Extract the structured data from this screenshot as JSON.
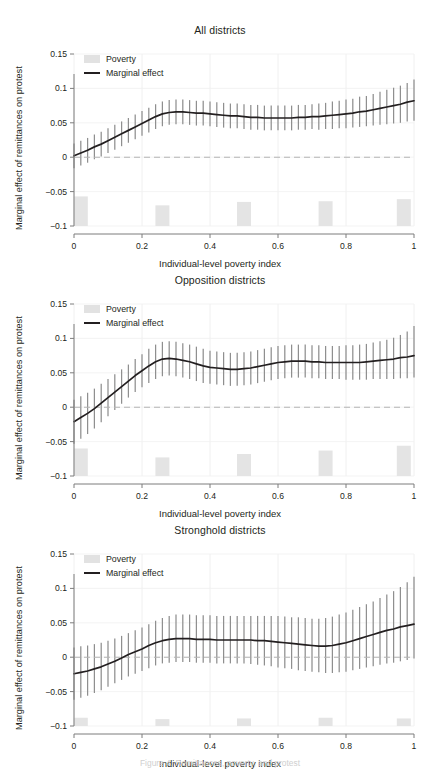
{
  "figure": {
    "caption": "Figure 4. Remittances, poverty, and protest",
    "axis_label_y": "Marginal effect of remittances on protest",
    "axis_label_x": "Individual-level poverty index",
    "legend": {
      "poverty_label": "Poverty",
      "marginal_label": "Marginal effect",
      "poverty_swatch_color": "#e2e2e2",
      "marginal_line_color": "#231f20"
    },
    "colors": {
      "line": "#231f20",
      "errorbar": "#8f8f8f",
      "poverty_bar": "#e4e4e4",
      "gridline": "#f0f0f0",
      "zero_line": "#b5b5b5",
      "axis": "#7d7d7d",
      "text": "#231f20"
    }
  },
  "chart_data": [
    {
      "type": "line",
      "title": "All districts",
      "xlabel": "Individual-level poverty index",
      "ylabel": "Marginal effect of remittances on protest",
      "xlim": [
        0,
        1
      ],
      "ylim": [
        -0.1,
        0.15
      ],
      "xticks": [
        0,
        0.2,
        0.4,
        0.6,
        0.8,
        1
      ],
      "xticklabels": [
        "0",
        "0.2",
        "0.4",
        "0.6",
        "0.8",
        "1"
      ],
      "yticks": [
        -0.1,
        -0.05,
        0,
        0.05,
        0.1,
        0.15
      ],
      "yticklabels": [
        "−0.1",
        "−0.05",
        "0",
        "0.05",
        "0.1",
        "0.15"
      ],
      "grid": true,
      "legend_position": "top-left",
      "zero_reference_line": 0,
      "series": [
        {
          "name": "Marginal effect",
          "x": [
            0.0,
            0.02,
            0.04,
            0.06,
            0.08,
            0.1,
            0.12,
            0.14,
            0.16,
            0.18,
            0.2,
            0.22,
            0.24,
            0.26,
            0.28,
            0.3,
            0.32,
            0.34,
            0.36,
            0.38,
            0.4,
            0.42,
            0.44,
            0.46,
            0.48,
            0.5,
            0.52,
            0.54,
            0.56,
            0.58,
            0.6,
            0.62,
            0.64,
            0.66,
            0.68,
            0.7,
            0.72,
            0.74,
            0.76,
            0.78,
            0.8,
            0.82,
            0.84,
            0.86,
            0.88,
            0.9,
            0.92,
            0.94,
            0.96,
            0.98,
            1.0
          ],
          "values": [
            0.002,
            0.006,
            0.01,
            0.015,
            0.019,
            0.024,
            0.029,
            0.034,
            0.039,
            0.044,
            0.049,
            0.054,
            0.059,
            0.063,
            0.065,
            0.066,
            0.066,
            0.065,
            0.064,
            0.064,
            0.063,
            0.062,
            0.061,
            0.06,
            0.06,
            0.059,
            0.058,
            0.058,
            0.057,
            0.057,
            0.057,
            0.057,
            0.057,
            0.058,
            0.058,
            0.059,
            0.059,
            0.06,
            0.061,
            0.062,
            0.063,
            0.064,
            0.066,
            0.067,
            0.069,
            0.071,
            0.073,
            0.075,
            0.077,
            0.08,
            0.082
          ],
          "ci_lower": [
            -0.016,
            -0.012,
            -0.008,
            -0.003,
            0.001,
            0.006,
            0.011,
            0.016,
            0.021,
            0.026,
            0.031,
            0.036,
            0.041,
            0.045,
            0.047,
            0.048,
            0.048,
            0.047,
            0.046,
            0.046,
            0.045,
            0.044,
            0.043,
            0.042,
            0.042,
            0.041,
            0.04,
            0.04,
            0.039,
            0.039,
            0.039,
            0.039,
            0.039,
            0.04,
            0.04,
            0.041,
            0.04,
            0.041,
            0.041,
            0.042,
            0.042,
            0.043,
            0.044,
            0.045,
            0.046,
            0.047,
            0.048,
            0.049,
            0.05,
            0.052,
            0.053
          ],
          "ci_upper": [
            0.02,
            0.024,
            0.028,
            0.033,
            0.037,
            0.042,
            0.047,
            0.052,
            0.057,
            0.062,
            0.067,
            0.072,
            0.077,
            0.081,
            0.083,
            0.084,
            0.084,
            0.083,
            0.082,
            0.082,
            0.081,
            0.08,
            0.079,
            0.078,
            0.078,
            0.077,
            0.076,
            0.076,
            0.075,
            0.075,
            0.075,
            0.075,
            0.075,
            0.076,
            0.076,
            0.077,
            0.078,
            0.079,
            0.081,
            0.082,
            0.084,
            0.085,
            0.088,
            0.089,
            0.092,
            0.095,
            0.098,
            0.101,
            0.104,
            0.108,
            0.113
          ]
        }
      ],
      "poverty_bars": [
        {
          "x": 0.02,
          "top": -0.057
        },
        {
          "x": 0.26,
          "top": -0.07
        },
        {
          "x": 0.5,
          "top": -0.065
        },
        {
          "x": 0.74,
          "top": -0.064
        },
        {
          "x": 0.97,
          "top": -0.061
        }
      ]
    },
    {
      "type": "line",
      "title": "Opposition districts",
      "xlabel": "Individual-level poverty index",
      "ylabel": "Marginal effect of remittances on protest",
      "xlim": [
        0,
        1
      ],
      "ylim": [
        -0.1,
        0.15
      ],
      "xticks": [
        0,
        0.2,
        0.4,
        0.6,
        0.8,
        1
      ],
      "xticklabels": [
        "0",
        "0.2",
        "0.4",
        "0.6",
        "0.8",
        "1"
      ],
      "yticks": [
        -0.1,
        -0.05,
        0,
        0.05,
        0.1,
        0.15
      ],
      "yticklabels": [
        "−0.1",
        "−0.05",
        "0",
        "0.05",
        "0.1",
        "0.15"
      ],
      "grid": true,
      "legend_position": "top-left",
      "zero_reference_line": 0,
      "series": [
        {
          "name": "Marginal effect",
          "x": [
            0.0,
            0.02,
            0.04,
            0.06,
            0.08,
            0.1,
            0.12,
            0.14,
            0.16,
            0.18,
            0.2,
            0.22,
            0.24,
            0.26,
            0.28,
            0.3,
            0.32,
            0.34,
            0.36,
            0.38,
            0.4,
            0.42,
            0.44,
            0.46,
            0.48,
            0.5,
            0.52,
            0.54,
            0.56,
            0.58,
            0.6,
            0.62,
            0.64,
            0.66,
            0.68,
            0.7,
            0.72,
            0.74,
            0.76,
            0.78,
            0.8,
            0.82,
            0.84,
            0.86,
            0.88,
            0.9,
            0.92,
            0.94,
            0.96,
            0.98,
            1.0
          ],
          "values": [
            -0.021,
            -0.015,
            -0.009,
            -0.002,
            0.006,
            0.014,
            0.022,
            0.03,
            0.038,
            0.046,
            0.053,
            0.06,
            0.066,
            0.07,
            0.071,
            0.07,
            0.068,
            0.066,
            0.063,
            0.06,
            0.058,
            0.057,
            0.056,
            0.055,
            0.055,
            0.056,
            0.057,
            0.059,
            0.061,
            0.063,
            0.065,
            0.066,
            0.067,
            0.067,
            0.067,
            0.066,
            0.066,
            0.065,
            0.065,
            0.065,
            0.065,
            0.065,
            0.065,
            0.066,
            0.067,
            0.068,
            0.069,
            0.07,
            0.072,
            0.073,
            0.075
          ],
          "ci_lower": [
            -0.053,
            -0.046,
            -0.039,
            -0.031,
            -0.022,
            -0.013,
            -0.004,
            0.005,
            0.014,
            0.022,
            0.029,
            0.035,
            0.041,
            0.045,
            0.046,
            0.045,
            0.043,
            0.041,
            0.038,
            0.035,
            0.034,
            0.033,
            0.032,
            0.031,
            0.031,
            0.032,
            0.033,
            0.035,
            0.037,
            0.039,
            0.041,
            0.042,
            0.043,
            0.043,
            0.043,
            0.042,
            0.042,
            0.041,
            0.041,
            0.041,
            0.04,
            0.04,
            0.04,
            0.04,
            0.041,
            0.041,
            0.041,
            0.041,
            0.042,
            0.042,
            0.043
          ],
          "ci_upper": [
            0.011,
            0.016,
            0.021,
            0.027,
            0.034,
            0.041,
            0.048,
            0.055,
            0.062,
            0.07,
            0.077,
            0.085,
            0.091,
            0.095,
            0.096,
            0.095,
            0.093,
            0.091,
            0.088,
            0.085,
            0.082,
            0.081,
            0.08,
            0.079,
            0.079,
            0.08,
            0.081,
            0.083,
            0.085,
            0.087,
            0.089,
            0.09,
            0.091,
            0.091,
            0.091,
            0.09,
            0.09,
            0.089,
            0.089,
            0.089,
            0.09,
            0.09,
            0.091,
            0.092,
            0.094,
            0.096,
            0.098,
            0.101,
            0.105,
            0.11,
            0.118
          ]
        }
      ],
      "poverty_bars": [
        {
          "x": 0.02,
          "top": -0.06
        },
        {
          "x": 0.26,
          "top": -0.073
        },
        {
          "x": 0.5,
          "top": -0.068
        },
        {
          "x": 0.74,
          "top": -0.063
        },
        {
          "x": 0.97,
          "top": -0.056
        }
      ]
    },
    {
      "type": "line",
      "title": "Stronghold districts",
      "xlabel": "Individual-level poverty index",
      "ylabel": "Marginal effect of remittances on protest",
      "xlim": [
        0,
        1
      ],
      "ylim": [
        -0.1,
        0.15
      ],
      "xticks": [
        0,
        0.2,
        0.4,
        0.6,
        0.8,
        1
      ],
      "xticklabels": [
        "0",
        "0.2",
        "0.4",
        "0.6",
        "0.8",
        "1"
      ],
      "yticks": [
        -0.1,
        -0.05,
        0,
        0.05,
        0.1,
        0.15
      ],
      "yticklabels": [
        "−0.1",
        "−0.05",
        "0",
        "0.05",
        "0.1",
        "0.15"
      ],
      "grid": true,
      "legend_position": "top-left",
      "zero_reference_line": 0,
      "series": [
        {
          "name": "Marginal effect",
          "x": [
            0.0,
            0.02,
            0.04,
            0.06,
            0.08,
            0.1,
            0.12,
            0.14,
            0.16,
            0.18,
            0.2,
            0.22,
            0.24,
            0.26,
            0.28,
            0.3,
            0.32,
            0.34,
            0.36,
            0.38,
            0.4,
            0.42,
            0.44,
            0.46,
            0.48,
            0.5,
            0.52,
            0.54,
            0.56,
            0.58,
            0.6,
            0.62,
            0.64,
            0.66,
            0.68,
            0.7,
            0.72,
            0.74,
            0.76,
            0.78,
            0.8,
            0.82,
            0.84,
            0.86,
            0.88,
            0.9,
            0.92,
            0.94,
            0.96,
            0.98,
            1.0
          ],
          "values": [
            -0.024,
            -0.022,
            -0.02,
            -0.017,
            -0.014,
            -0.01,
            -0.006,
            -0.001,
            0.004,
            0.008,
            0.012,
            0.017,
            0.021,
            0.024,
            0.026,
            0.027,
            0.027,
            0.027,
            0.026,
            0.026,
            0.026,
            0.025,
            0.025,
            0.025,
            0.025,
            0.025,
            0.025,
            0.024,
            0.024,
            0.023,
            0.022,
            0.021,
            0.02,
            0.019,
            0.018,
            0.017,
            0.016,
            0.016,
            0.017,
            0.019,
            0.021,
            0.024,
            0.027,
            0.03,
            0.033,
            0.036,
            0.039,
            0.041,
            0.044,
            0.046,
            0.048
          ],
          "ci_lower": [
            -0.062,
            -0.059,
            -0.056,
            -0.052,
            -0.048,
            -0.043,
            -0.038,
            -0.033,
            -0.028,
            -0.024,
            -0.02,
            -0.016,
            -0.012,
            -0.009,
            -0.008,
            -0.007,
            -0.007,
            -0.007,
            -0.008,
            -0.008,
            -0.008,
            -0.009,
            -0.009,
            -0.009,
            -0.009,
            -0.009,
            -0.01,
            -0.011,
            -0.012,
            -0.013,
            -0.015,
            -0.016,
            -0.017,
            -0.019,
            -0.02,
            -0.021,
            -0.022,
            -0.023,
            -0.023,
            -0.022,
            -0.021,
            -0.019,
            -0.017,
            -0.015,
            -0.013,
            -0.011,
            -0.009,
            -0.008,
            -0.006,
            -0.004,
            -0.002
          ],
          "ci_upper": [
            0.014,
            0.016,
            0.017,
            0.019,
            0.021,
            0.024,
            0.027,
            0.031,
            0.035,
            0.039,
            0.043,
            0.048,
            0.053,
            0.057,
            0.06,
            0.062,
            0.062,
            0.062,
            0.061,
            0.061,
            0.061,
            0.06,
            0.06,
            0.06,
            0.06,
            0.06,
            0.06,
            0.06,
            0.06,
            0.06,
            0.06,
            0.059,
            0.058,
            0.058,
            0.057,
            0.056,
            0.056,
            0.057,
            0.059,
            0.062,
            0.065,
            0.069,
            0.073,
            0.077,
            0.081,
            0.086,
            0.091,
            0.096,
            0.102,
            0.109,
            0.117
          ]
        }
      ],
      "poverty_bars": [
        {
          "x": 0.02,
          "top": -0.088
        },
        {
          "x": 0.26,
          "top": -0.09
        },
        {
          "x": 0.5,
          "top": -0.089
        },
        {
          "x": 0.74,
          "top": -0.088
        },
        {
          "x": 0.97,
          "top": -0.089
        }
      ]
    }
  ]
}
